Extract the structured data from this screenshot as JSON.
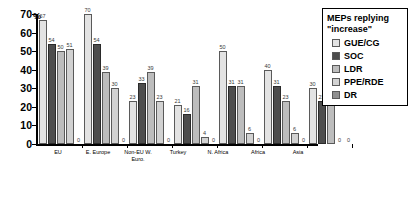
{
  "chart_data": {
    "type": "bar",
    "title": "",
    "xlabel": "",
    "ylabel": "%",
    "ylim": [
      0,
      70
    ],
    "yticks": [
      0,
      10,
      20,
      30,
      40,
      50,
      60,
      70
    ],
    "grid": false,
    "legend_position": "right",
    "legend_title_line1": "MEPs replying",
    "legend_title_line2": "\"increase\"",
    "categories": [
      "EU",
      "E. Europe",
      "Non-EU W. Euro.",
      "Turkey",
      "N. Africa",
      "Africa",
      "Asia"
    ],
    "series": [
      {
        "name": "GUE/CG",
        "color": "#e3e3e3",
        "values": [
          67,
          70,
          23,
          21,
          50,
          40,
          30
        ]
      },
      {
        "name": "SOC",
        "color": "#4d4d4d",
        "values": [
          54,
          54,
          33,
          16,
          31,
          31,
          23
        ]
      },
      {
        "name": "LDR",
        "color": "#bdbdbd",
        "values": [
          50,
          39,
          39,
          31,
          31,
          23,
          23
        ]
      },
      {
        "name": "PPE/RDE",
        "color": "#d2d2d2",
        "values": [
          51,
          30,
          23,
          4,
          6,
          6,
          0
        ]
      },
      {
        "name": "DR",
        "color": "#8f8f8f",
        "values": [
          0,
          0,
          0,
          0,
          0,
          0,
          0
        ]
      }
    ]
  },
  "axis": {
    "percent_symbol": "%",
    "tick_labels": [
      "70",
      "60",
      "50",
      "40",
      "30",
      "20",
      "10",
      "0"
    ]
  }
}
